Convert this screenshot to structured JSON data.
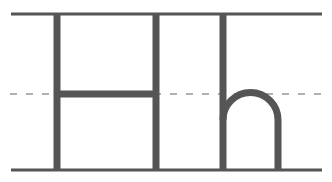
{
  "diagram": {
    "title": "Handwriting guide: Hh",
    "letters": [
      "H",
      "h"
    ],
    "colors": {
      "guide_line": "#555555",
      "midline": "#aaaaaa",
      "stroke": "#555555",
      "background": "#ffffff"
    }
  }
}
